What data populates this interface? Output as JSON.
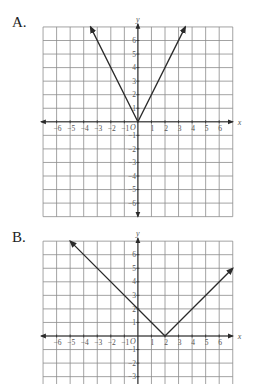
{
  "options": [
    {
      "label": "A.",
      "function": "y = 2|x|"
    },
    {
      "label": "B.",
      "function": "y = |x - 2|"
    }
  ],
  "axes": {
    "x_label": "x",
    "y_label": "y",
    "origin_label": "O"
  },
  "colors": {
    "grid": "#8c8c8c",
    "axis": "#2a2a2a",
    "line": "#2a2a2a",
    "text": "#555555"
  },
  "chart_data": [
    {
      "type": "line",
      "title": "A.",
      "xlabel": "x",
      "ylabel": "y",
      "xlim": [
        -7,
        7
      ],
      "ylim": [
        -7,
        7
      ],
      "grid": true,
      "x_ticks": [
        -6,
        -5,
        -4,
        -3,
        -2,
        -1,
        1,
        2,
        3,
        4,
        5,
        6
      ],
      "y_ticks": [
        -6,
        -5,
        -4,
        -3,
        -2,
        -1,
        1,
        2,
        3,
        4,
        5,
        6
      ],
      "series": [
        {
          "name": "y = 2|x|",
          "points": [
            [
              -3.5,
              7
            ],
            [
              0,
              0
            ],
            [
              3.5,
              7
            ]
          ],
          "arrows": "both"
        }
      ]
    },
    {
      "type": "line",
      "title": "B.",
      "xlabel": "x",
      "ylabel": "y",
      "xlim": [
        -7,
        7
      ],
      "ylim": [
        -3.6,
        7
      ],
      "grid": true,
      "x_ticks": [
        -6,
        -5,
        -4,
        -3,
        -2,
        -1,
        1,
        2,
        3,
        4,
        5,
        6
      ],
      "y_ticks": [
        -3,
        -2,
        -1,
        1,
        2,
        3,
        4,
        5,
        6
      ],
      "series": [
        {
          "name": "y = |x - 2|",
          "points": [
            [
              -5,
              7
            ],
            [
              2,
              0
            ],
            [
              7,
              5
            ]
          ],
          "arrows": "both"
        }
      ]
    }
  ]
}
